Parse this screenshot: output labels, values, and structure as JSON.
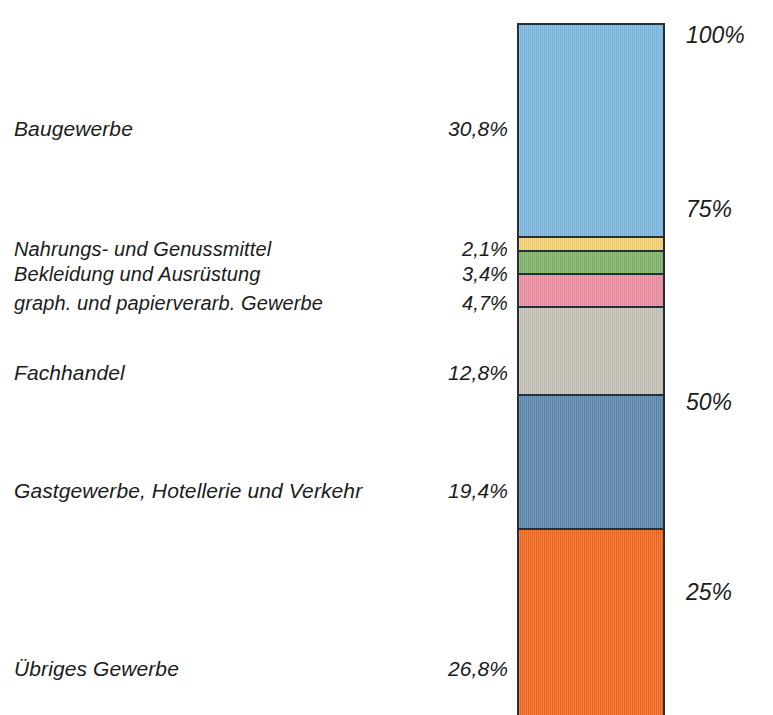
{
  "chart_data": {
    "type": "bar",
    "title": "",
    "subtitle": "",
    "xlabel": "",
    "ylabel": "",
    "stacked": true,
    "orientation": "vertical",
    "normalized_to_100": true,
    "grid": false,
    "legend_position": "left-labels",
    "ylim": [
      0,
      100
    ],
    "axis_ticks": [
      {
        "label": "100%",
        "value": 100,
        "y": 38
      },
      {
        "label": "75%",
        "value": 75,
        "y": 212
      },
      {
        "label": "50%",
        "value": 50,
        "y": 405
      },
      {
        "label": "25%",
        "value": 25,
        "y": 595
      }
    ],
    "categories": [
      "Baugewerbe",
      "Nahrungs- und Genussmittel",
      "Bekleidung und Ausrüstung",
      "graph. und papierverarb. Gewerbe",
      "Fachhandel",
      "Gastgewerbe, Hotellerie und Verkehr",
      "Übriges Gewerbe"
    ],
    "values": [
      30.8,
      2.1,
      3.4,
      4.7,
      12.8,
      19.4,
      26.8
    ],
    "value_labels": [
      "30,8%",
      "2,1%",
      "3,4%",
      "4,7%",
      "12,8%",
      "19,4%",
      "26,8%"
    ],
    "colors": [
      "#7cb9e0",
      "#f5d272",
      "#81b467",
      "#ee8fa0",
      "#c6c3b6",
      "#5b87ad",
      "#f4681e"
    ],
    "segments": [
      {
        "label": "Baugewerbe",
        "value": 30.8,
        "value_label": "30,8%",
        "color": "#7cb9e0",
        "label_y": 133,
        "tight": false
      },
      {
        "label": "Nahrungs- und Genussmittel",
        "value": 2.1,
        "value_label": "2,1%",
        "color": "#f5d272",
        "label_y": 254,
        "tight": true
      },
      {
        "label": "Bekleidung und Ausrüstung",
        "value": 3.4,
        "value_label": "3,4%",
        "color": "#81b467",
        "label_y": 279,
        "tight": true
      },
      {
        "label": "graph. und papierverarb. Gewerbe",
        "value": 4.7,
        "value_label": "4,7%",
        "color": "#ee8fa0",
        "label_y": 308,
        "tight": true
      },
      {
        "label": "Fachhandel",
        "value": 12.8,
        "value_label": "12,8%",
        "color": "#c6c3b6",
        "label_y": 377,
        "tight": false
      },
      {
        "label": "Gastgewerbe, Hotellerie und Verkehr",
        "value": 19.4,
        "value_label": "19,4%",
        "color": "#5b87ad",
        "label_y": 495,
        "tight": false
      },
      {
        "label": "Übriges Gewerbe",
        "value": 26.8,
        "value_label": "26,8%",
        "color": "#f4681e",
        "label_y": 673,
        "tight": false
      }
    ]
  }
}
